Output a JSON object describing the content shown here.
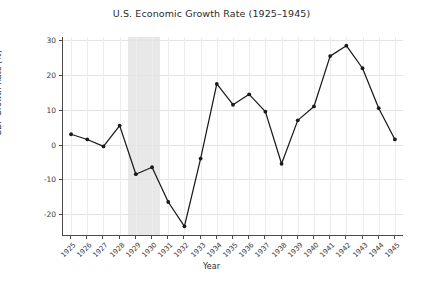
{
  "chart_data": {
    "type": "line",
    "title": "U.S. Economic Growth Rate (1925–1945)",
    "xlabel": "Year",
    "ylabel": "GDP Growth Rate (%)",
    "categories": [
      1925,
      1926,
      1927,
      1928,
      1929,
      1930,
      1931,
      1932,
      1933,
      1934,
      1935,
      1936,
      1937,
      1938,
      1939,
      1940,
      1941,
      1942,
      1943,
      1944,
      1945
    ],
    "values": [
      3.0,
      1.5,
      -0.5,
      5.5,
      -8.5,
      -6.5,
      -16.5,
      -23.5,
      -4.0,
      17.5,
      11.5,
      14.5,
      9.5,
      -5.5,
      7.0,
      11.0,
      25.5,
      28.5,
      22.0,
      10.5,
      1.5
    ],
    "x": [
      "1925",
      "1926",
      "1927",
      "1928",
      "1929",
      "1930",
      "1931",
      "1932",
      "1933",
      "1934",
      "1935",
      "1936",
      "1937",
      "1938",
      "1939",
      "1940",
      "1941",
      "1942",
      "1943",
      "1944",
      "1945"
    ],
    "xlim": [
      1924.5,
      1945.5
    ],
    "ylim": [
      -26,
      31
    ],
    "yticks": [
      -20,
      -10,
      0,
      10,
      20,
      30
    ],
    "ytick_labels": [
      "-20",
      "-10",
      "0",
      "10",
      "20",
      "30"
    ],
    "xtick_labels": [
      "1925",
      "1926",
      "1927",
      "1928",
      "1929",
      "1930",
      "1931",
      "1932",
      "1933",
      "1934",
      "1935",
      "1936",
      "1937",
      "1938",
      "1939",
      "1940",
      "1941",
      "1942",
      "1943",
      "1944",
      "1945"
    ],
    "grid": true,
    "legend": null,
    "series": [
      {
        "name": "GDP Growth Rate",
        "color": "#1a1a1a",
        "marker": "circle",
        "values": [
          3.0,
          1.5,
          -0.5,
          5.5,
          -8.5,
          -6.5,
          -16.5,
          -23.5,
          -4.0,
          17.5,
          11.5,
          14.5,
          9.5,
          -5.5,
          7.0,
          11.0,
          25.5,
          28.5,
          22.0,
          10.5,
          1.5
        ]
      }
    ],
    "shaded_regions": [
      {
        "name": "recession-band",
        "x_start": 1928.5,
        "x_end": 1930.5,
        "color": "#e8e8e8"
      }
    ]
  },
  "colors": {
    "line": "#1a1a1a",
    "marker": "#111111",
    "grid": "#e4e4e4",
    "axis": "#4a4a4a",
    "band": "#e8e8e8",
    "text": "#2b2b2b",
    "background": "#ffffff"
  }
}
